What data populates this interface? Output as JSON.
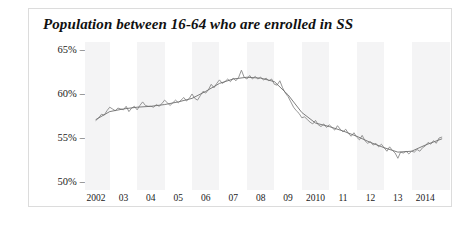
{
  "figure": {
    "title": "Population between 16-64 who are enrolled in SS",
    "caption": "",
    "frame_color": "#dcdcdc",
    "band_color": "#f4f4f5"
  },
  "chart_data": {
    "type": "line",
    "title": "Population between 16-64 who are enrolled in SS",
    "xlabel": "",
    "ylabel": "",
    "ylim": [
      49,
      65.8
    ],
    "xlim": [
      2001.6,
      2014.9
    ],
    "grid": false,
    "legend": "none",
    "yticks": [
      50,
      55,
      60,
      65
    ],
    "ytick_labels": [
      "50%",
      "55%",
      "60%",
      "65%"
    ],
    "xticks": [
      2002,
      2003,
      2004,
      2005,
      2006,
      2007,
      2008,
      2009,
      2010,
      2011,
      2012,
      2013,
      2014
    ],
    "xtick_labels": [
      "2002",
      "03",
      "04",
      "05",
      "06",
      "07",
      "08",
      "09",
      "2010",
      "11",
      "12",
      "13",
      "2014"
    ],
    "shaded_bands": [
      [
        2001.6,
        2002.5
      ],
      [
        2003.5,
        2004.5
      ],
      [
        2005.5,
        2006.5
      ],
      [
        2007.5,
        2008.5
      ],
      [
        2009.5,
        2010.5
      ],
      [
        2011.5,
        2012.5
      ],
      [
        2013.5,
        2014.9
      ]
    ],
    "series": [
      {
        "name": "monthly",
        "color": "#8a8a8a",
        "x": [
          2002.0,
          2002.1,
          2002.2,
          2002.3,
          2002.4,
          2002.5,
          2002.6,
          2002.7,
          2002.8,
          2002.9,
          2003.0,
          2003.1,
          2003.2,
          2003.3,
          2003.4,
          2003.5,
          2003.6,
          2003.7,
          2003.8,
          2003.9,
          2004.0,
          2004.1,
          2004.2,
          2004.3,
          2004.4,
          2004.5,
          2004.6,
          2004.7,
          2004.8,
          2004.9,
          2005.0,
          2005.1,
          2005.2,
          2005.3,
          2005.4,
          2005.5,
          2005.6,
          2005.7,
          2005.8,
          2005.9,
          2006.0,
          2006.1,
          2006.2,
          2006.3,
          2006.4,
          2006.5,
          2006.6,
          2006.7,
          2006.8,
          2006.9,
          2007.0,
          2007.1,
          2007.2,
          2007.3,
          2007.4,
          2007.5,
          2007.6,
          2007.7,
          2007.8,
          2007.9,
          2008.0,
          2008.1,
          2008.2,
          2008.3,
          2008.4,
          2008.5,
          2008.6,
          2008.7,
          2008.8,
          2008.9,
          2009.0,
          2009.1,
          2009.2,
          2009.3,
          2009.4,
          2009.5,
          2009.6,
          2009.7,
          2009.8,
          2009.9,
          2010.0,
          2010.1,
          2010.2,
          2010.3,
          2010.4,
          2010.5,
          2010.6,
          2010.7,
          2010.8,
          2010.9,
          2011.0,
          2011.1,
          2011.2,
          2011.3,
          2011.4,
          2011.5,
          2011.6,
          2011.7,
          2011.8,
          2011.9,
          2012.0,
          2012.1,
          2012.2,
          2012.3,
          2012.4,
          2012.5,
          2012.6,
          2012.7,
          2012.8,
          2012.9,
          2013.0,
          2013.1,
          2013.2,
          2013.3,
          2013.4,
          2013.5,
          2013.6,
          2013.7,
          2013.8,
          2013.9,
          2014.0,
          2014.1,
          2014.2,
          2014.3,
          2014.4,
          2014.5,
          2014.6
        ],
        "values": [
          56.9,
          57.2,
          57.6,
          57.5,
          58.0,
          58.4,
          58.2,
          58.0,
          58.3,
          58.2,
          58.1,
          58.5,
          57.9,
          58.3,
          58.5,
          58.1,
          58.6,
          59.0,
          58.6,
          58.5,
          58.5,
          58.4,
          58.7,
          58.5,
          58.8,
          59.2,
          58.9,
          58.6,
          58.9,
          59.2,
          58.9,
          59.2,
          59.5,
          59.1,
          59.4,
          59.9,
          59.4,
          59.2,
          59.7,
          60.2,
          60.0,
          60.4,
          61.0,
          60.6,
          61.1,
          61.5,
          61.1,
          61.3,
          61.6,
          61.3,
          61.7,
          61.4,
          61.8,
          62.6,
          61.8,
          61.6,
          62.0,
          61.6,
          61.9,
          61.6,
          61.8,
          61.5,
          61.7,
          61.4,
          61.6,
          61.0,
          60.9,
          61.4,
          60.6,
          60.0,
          59.6,
          59.0,
          58.4,
          58.0,
          57.7,
          57.2,
          57.3,
          57.0,
          56.7,
          56.5,
          56.9,
          56.4,
          56.2,
          56.5,
          56.1,
          56.4,
          56.1,
          55.8,
          56.3,
          55.9,
          55.6,
          55.9,
          55.4,
          55.1,
          55.5,
          55.0,
          54.7,
          55.2,
          54.6,
          54.3,
          54.5,
          54.1,
          54.3,
          53.9,
          54.2,
          53.8,
          53.4,
          53.9,
          53.5,
          53.2,
          52.6,
          53.3,
          53.2,
          53.4,
          53.1,
          53.4,
          53.3,
          53.6,
          53.4,
          53.8,
          54.0,
          54.4,
          54.2,
          54.6,
          54.3,
          54.9,
          55.0
        ]
      },
      {
        "name": "trend",
        "color": "#6e6e6e",
        "x": [
          2002.0,
          2002.5,
          2003.0,
          2003.5,
          2004.0,
          2004.5,
          2005.0,
          2005.5,
          2006.0,
          2006.5,
          2007.0,
          2007.5,
          2008.0,
          2008.5,
          2009.0,
          2009.5,
          2010.0,
          2010.5,
          2011.0,
          2011.5,
          2012.0,
          2012.5,
          2013.0,
          2013.5,
          2014.0,
          2014.6
        ],
        "values": [
          57.0,
          57.9,
          58.2,
          58.4,
          58.5,
          58.7,
          59.0,
          59.4,
          60.2,
          61.1,
          61.6,
          61.8,
          61.7,
          61.3,
          59.8,
          57.8,
          56.6,
          56.2,
          55.7,
          55.1,
          54.4,
          53.8,
          53.3,
          53.4,
          54.1,
          54.8
        ]
      }
    ]
  }
}
